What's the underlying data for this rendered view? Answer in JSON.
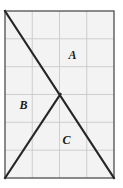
{
  "figure": {
    "canvas": {
      "width": 123,
      "height": 188,
      "background": "#ffffff"
    },
    "colors": {
      "plot_background": "#f3f3f3",
      "grid_line": "#c9c9c9",
      "border_line": "#5a5a5a",
      "diagonal_line": "#262626",
      "label_text": "#1a1a1a"
    },
    "rectangle": {
      "x_left": 5,
      "x_right": 114,
      "y_top": 11,
      "y_bottom": 178,
      "stroke_width": 1.4
    },
    "grid": {
      "columns": 4,
      "rows": 6,
      "vertical_lines_x": [
        32.25,
        59.5,
        86.75
      ],
      "horizontal_lines_y": [
        38.8,
        66.7,
        94.5,
        122.3,
        150.2
      ],
      "show": true,
      "stroke_width": 0.9
    },
    "lines": [
      {
        "name": "main-diagonal",
        "description": "diagonal from top-left corner to bottom-right corner",
        "x1": 5,
        "y1": 11,
        "x2": 114,
        "y2": 178,
        "stroke_width": 2.1
      },
      {
        "name": "secondary-diagonal",
        "description": "segment from bottom-left corner up to the crossing point",
        "x1": 5,
        "y1": 178,
        "x2": 60.5,
        "y2": 94.0,
        "stroke_width": 2.1
      }
    ],
    "intersection": {
      "x": 60.5,
      "y": 94.0,
      "label": ""
    },
    "labels": [
      {
        "id": "A",
        "text": "A",
        "x": 72.5,
        "y": 56.5
      },
      {
        "id": "B",
        "text": "B",
        "x": 23.5,
        "y": 106.5
      },
      {
        "id": "C",
        "text": "C",
        "x": 66.5,
        "y": 141.5
      }
    ]
  }
}
